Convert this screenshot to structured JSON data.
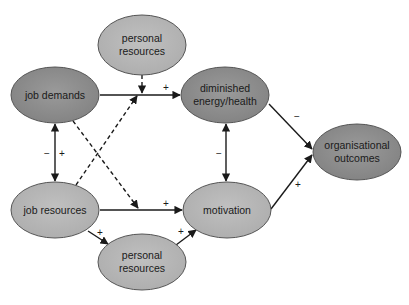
{
  "diagram": {
    "type": "path-model",
    "colors": {
      "dark_node": "#8c8c8c",
      "light_node": "#b5b5b5",
      "stroke": "#4a4a4a",
      "edge": "#1a1a1a",
      "background": "#ffffff"
    },
    "nodes": {
      "personal_resources_top": {
        "line1": "personal",
        "line2": "resources"
      },
      "job_demands": {
        "line1": "job demands"
      },
      "diminished_energy": {
        "line1": "diminished",
        "line2": "energy/health"
      },
      "organisational_outcomes": {
        "line1": "organisational",
        "line2": "outcomes"
      },
      "job_resources": {
        "line1": "job resources"
      },
      "motivation": {
        "line1": "motivation"
      },
      "personal_resources_bottom": {
        "line1": "personal",
        "line2": "resources"
      }
    },
    "edges": [
      {
        "from": "job demands",
        "to": "diminished energy/health",
        "style": "solid",
        "sign": "+"
      },
      {
        "from": "personal resources (top)",
        "to": "job demands → diminished energy/health",
        "style": "dashed",
        "sign": ""
      },
      {
        "from": "job resources",
        "to": "job demands → diminished energy/health",
        "style": "dashed",
        "sign": ""
      },
      {
        "from": "job demands",
        "to": "job resources → motivation",
        "style": "dashed",
        "sign": ""
      },
      {
        "from": "job demands",
        "to": "job resources",
        "style": "solid-bidirectional",
        "signs": [
          "−",
          "+"
        ]
      },
      {
        "from": "diminished energy/health",
        "to": "motivation",
        "style": "solid-bidirectional",
        "sign": "−"
      },
      {
        "from": "diminished energy/health",
        "to": "organisational outcomes",
        "style": "solid",
        "sign": "−"
      },
      {
        "from": "motivation",
        "to": "organisational outcomes",
        "style": "solid",
        "sign": "+"
      },
      {
        "from": "job resources",
        "to": "motivation",
        "style": "solid",
        "sign": "+"
      },
      {
        "from": "job resources",
        "to": "personal resources (bottom)",
        "style": "solid",
        "sign": "+"
      },
      {
        "from": "personal resources (bottom)",
        "to": "motivation",
        "style": "solid",
        "sign": "+"
      }
    ],
    "signs": {
      "jd_to_energy": "+",
      "jd_jr_minus": "−",
      "jd_jr_plus": "+",
      "energy_motivation": "−",
      "energy_outcomes": "−",
      "motivation_outcomes": "+",
      "jr_motivation": "+",
      "jr_pr": "+",
      "pr_motivation": "+"
    }
  }
}
